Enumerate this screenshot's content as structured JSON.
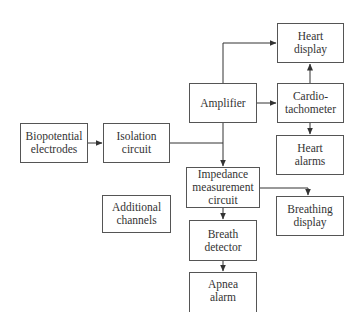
{
  "diagram": {
    "type": "block-diagram",
    "nodes": [
      {
        "id": "biopotential",
        "label": "Biopotential\nelectrodes",
        "x": 20,
        "y": 123,
        "w": 68,
        "h": 40
      },
      {
        "id": "isolation",
        "label": "Isolation\ncircuit",
        "x": 103,
        "y": 123,
        "w": 67,
        "h": 40
      },
      {
        "id": "amplifier",
        "label": "Amplifier",
        "x": 189,
        "y": 83,
        "w": 68,
        "h": 40
      },
      {
        "id": "heart_display",
        "label": "Heart\ndisplay",
        "x": 277,
        "y": 23,
        "w": 67,
        "h": 40
      },
      {
        "id": "cardiotachometer",
        "label": "Cardio-\ntachometer",
        "x": 277,
        "y": 83,
        "w": 67,
        "h": 40
      },
      {
        "id": "heart_alarms",
        "label": "Heart\nalarms",
        "x": 276,
        "y": 135,
        "w": 68,
        "h": 40
      },
      {
        "id": "impedance",
        "label": "Impedance\nmeasurement\ncircuit",
        "x": 186,
        "y": 167,
        "w": 74,
        "h": 41
      },
      {
        "id": "breathing_display",
        "label": "Breathing\ndisplay",
        "x": 276,
        "y": 196,
        "w": 68,
        "h": 40
      },
      {
        "id": "additional_channels",
        "label": "Additional\nchannels",
        "x": 102,
        "y": 195,
        "w": 69,
        "h": 38
      },
      {
        "id": "breath_detector",
        "label": "Breath\ndetector",
        "x": 189,
        "y": 220,
        "w": 68,
        "h": 41
      },
      {
        "id": "apnea_alarm",
        "label": "Apnea\nalarm",
        "x": 189,
        "y": 272,
        "w": 68,
        "h": 40
      }
    ],
    "edges": [
      {
        "from": "biopotential",
        "to": "isolation"
      },
      {
        "from": "isolation",
        "to": "impedance",
        "via": "junction"
      },
      {
        "from": "isolation",
        "to": "amplifier",
        "via": "junction"
      },
      {
        "from": "amplifier",
        "to": "heart_display"
      },
      {
        "from": "amplifier",
        "to": "cardiotachometer"
      },
      {
        "from": "cardiotachometer",
        "to": "heart_display"
      },
      {
        "from": "cardiotachometer",
        "to": "heart_alarms"
      },
      {
        "from": "impedance",
        "to": "breathing_display"
      },
      {
        "from": "impedance",
        "to": "breath_detector"
      },
      {
        "from": "breath_detector",
        "to": "apnea_alarm"
      }
    ],
    "colors": {
      "line": "#333333",
      "border": "#555555",
      "text": "#333333",
      "background": "#ffffff"
    }
  }
}
